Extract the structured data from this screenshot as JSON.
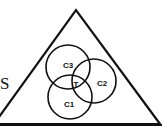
{
  "diagram": {
    "outer_label": "S",
    "circles": [
      {
        "id": "c1",
        "label": "C1"
      },
      {
        "id": "c2",
        "label": "C2"
      },
      {
        "id": "c3",
        "label": "C3"
      }
    ],
    "intersection_label": "T"
  },
  "colors": {
    "stroke": "#111111",
    "background": "#ffffff"
  }
}
